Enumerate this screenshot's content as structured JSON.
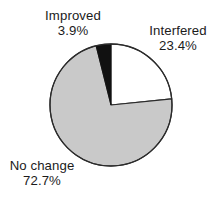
{
  "figure": {
    "background_color": "#ffffff",
    "outline_color": "#2b2b2b"
  },
  "chart_data": {
    "type": "pie",
    "title": "",
    "subtitle": "",
    "xlabel": "",
    "ylabel": "",
    "grid": false,
    "legend_position": "none",
    "labels_placement": "outside-callout",
    "start_angle_deg": 0,
    "direction": "clockwise",
    "center": {
      "x": 111,
      "y": 105
    },
    "radius": 61,
    "categories": [
      "Interfered",
      "No change",
      "Improved"
    ],
    "values": [
      23.4,
      72.7,
      3.9
    ],
    "value_unit": "%",
    "slices": [
      {
        "label": "Interfered",
        "value": 23.4,
        "value_text": "23.4%",
        "color": "#ffffff",
        "start_deg": 0.0,
        "end_deg": 84.2
      },
      {
        "label": "No change",
        "value": 72.7,
        "value_text": "72.7%",
        "color": "#c9c9c9",
        "start_deg": 84.2,
        "end_deg": 345.9
      },
      {
        "label": "Improved",
        "value": 3.9,
        "value_text": "3.9%",
        "color": "#111111",
        "start_deg": 345.9,
        "end_deg": 360.0
      }
    ]
  },
  "labels": {
    "improved": {
      "name": "Improved",
      "percent": "3.9%"
    },
    "interfered": {
      "name": "Interfered",
      "percent": "23.4%"
    },
    "no_change": {
      "name": "No change",
      "percent": "72.7%"
    }
  }
}
